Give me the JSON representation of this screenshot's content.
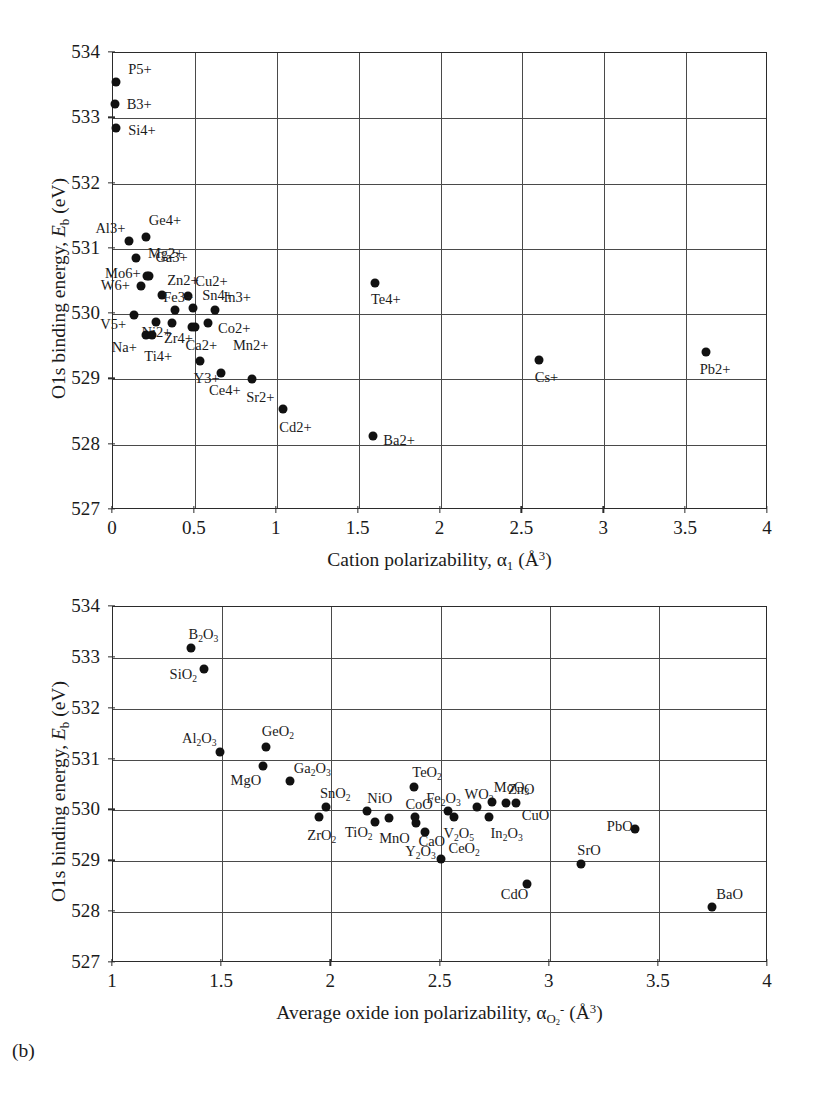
{
  "figure": {
    "panel_tag_b": "(b)",
    "y_axis_title_prefix": "O1s binding energy, ",
    "y_axis_title_symbol": "E",
    "y_axis_title_symbol_sub": "b",
    "y_axis_title_unit": " (eV)",
    "y_ticks": [
      "527",
      "528",
      "529",
      "530",
      "531",
      "532",
      "533",
      "534"
    ],
    "y_min": 527,
    "y_max": 534
  },
  "chart_data": [
    {
      "type": "scatter",
      "panel": "a",
      "title": "",
      "xlabel": "Cation polarizability, α₁ (Å³)",
      "ylabel": "O1s binding energy, Eb (eV)",
      "xlim": [
        0,
        4
      ],
      "ylim": [
        527,
        534
      ],
      "xticks": [
        "0",
        "0.5",
        "1",
        "1.5",
        "2",
        "2.5",
        "3",
        "3.5",
        "4"
      ],
      "yticks": [
        "527",
        "528",
        "529",
        "530",
        "531",
        "532",
        "533",
        "534"
      ],
      "grid": true,
      "legend": "none",
      "points": [
        {
          "label": "P5+",
          "x": 0.02,
          "y": 533.55,
          "lx": 12,
          "ly": -14
        },
        {
          "label": "B3+",
          "x": 0.01,
          "y": 533.22,
          "lx": 12,
          "ly": -1
        },
        {
          "label": "Si4+",
          "x": 0.02,
          "y": 532.85,
          "lx": 12,
          "ly": 1
        },
        {
          "label": "Al3+",
          "x": 0.1,
          "y": 531.12,
          "lx": -34,
          "ly": -14
        },
        {
          "label": "Ge4+",
          "x": 0.2,
          "y": 531.18,
          "lx": 3,
          "ly": -18
        },
        {
          "label": "Mg2+",
          "x": 0.14,
          "y": 530.86,
          "lx": 12,
          "ly": -6
        },
        {
          "label": "Mo6+",
          "x": 0.22,
          "y": 530.58,
          "lx": -44,
          "ly": -4
        },
        {
          "label": "Ga3+",
          "x": 0.21,
          "y": 530.58,
          "lx": 8,
          "ly": -20
        },
        {
          "label": "W6+",
          "x": 0.17,
          "y": 530.43,
          "lx": -40,
          "ly": -2
        },
        {
          "label": "Zn2+",
          "x": 0.3,
          "y": 530.3,
          "lx": 5,
          "ly": -16
        },
        {
          "label": "Cu2+",
          "x": 0.46,
          "y": 530.28,
          "lx": 7,
          "ly": -16
        },
        {
          "label": "Fe3+",
          "x": 0.38,
          "y": 530.06,
          "lx": -12,
          "ly": -14
        },
        {
          "label": "Sn4+",
          "x": 0.49,
          "y": 530.1,
          "lx": 9,
          "ly": -14
        },
        {
          "label": "In3+",
          "x": 0.62,
          "y": 530.07,
          "lx": 9,
          "ly": -14
        },
        {
          "label": "V5+",
          "x": 0.13,
          "y": 529.98,
          "lx": -34,
          "ly": 8
        },
        {
          "label": "Ni2+",
          "x": 0.26,
          "y": 529.88,
          "lx": -14,
          "ly": 9
        },
        {
          "label": "Zr4+",
          "x": 0.36,
          "y": 529.86,
          "lx": -8,
          "ly": 14
        },
        {
          "label": "Co2+",
          "x": 0.58,
          "y": 529.86,
          "lx": 10,
          "ly": 4
        },
        {
          "label": "Ca2+",
          "x": 0.48,
          "y": 529.8,
          "lx": -6,
          "ly": 17
        },
        {
          "label": "Mn2+",
          "x": 0.5,
          "y": 529.8,
          "lx": 38,
          "ly": 17
        },
        {
          "label": "Na+",
          "x": 0.2,
          "y": 529.68,
          "lx": -34,
          "ly": 11
        },
        {
          "label": "Ti4+",
          "x": 0.24,
          "y": 529.68,
          "lx": -8,
          "ly": 20
        },
        {
          "label": "Y3+",
          "x": 0.53,
          "y": 529.28,
          "lx": -6,
          "ly": 16
        },
        {
          "label": "Ce4+",
          "x": 0.66,
          "y": 529.1,
          "lx": -12,
          "ly": 16
        },
        {
          "label": "Sr2+",
          "x": 0.85,
          "y": 529.0,
          "lx": -6,
          "ly": 17
        },
        {
          "label": "Cd2+",
          "x": 1.04,
          "y": 528.55,
          "lx": -4,
          "ly": 17
        },
        {
          "label": "Ba2+",
          "x": 1.59,
          "y": 528.13,
          "lx": 10,
          "ly": 3
        },
        {
          "label": "Te4+",
          "x": 1.6,
          "y": 530.47,
          "lx": -4,
          "ly": 15
        },
        {
          "label": "Cs+",
          "x": 2.6,
          "y": 529.3,
          "lx": -4,
          "ly": 16
        },
        {
          "label": "Pb2+",
          "x": 3.62,
          "y": 529.42,
          "lx": -6,
          "ly": 16
        }
      ]
    },
    {
      "type": "scatter",
      "panel": "b",
      "title": "",
      "xlabel": "Average oxide ion polarizability, αO2- (Å³)",
      "ylabel": "O1s binding energy, Eb (eV)",
      "xlim": [
        1,
        4
      ],
      "ylim": [
        527,
        534
      ],
      "xticks": [
        "1",
        "1.5",
        "2",
        "2.5",
        "3",
        "3.5",
        "4"
      ],
      "yticks": [
        "527",
        "528",
        "529",
        "530",
        "531",
        "532",
        "533",
        "534"
      ],
      "grid": true,
      "legend": "none",
      "points": [
        {
          "label": "B2O3",
          "html": "B<sub>2</sub>O<sub>3</sub>",
          "x": 1.355,
          "y": 533.19,
          "lx": -2,
          "ly": -15
        },
        {
          "label": "SiO2",
          "html": "SiO<sub>2</sub>",
          "x": 1.415,
          "y": 532.78,
          "lx": -34,
          "ly": 4
        },
        {
          "label": "Al2O3",
          "html": "Al<sub>2</sub>O<sub>3</sub>",
          "x": 1.49,
          "y": 531.14,
          "lx": -38,
          "ly": -15
        },
        {
          "label": "GeO2",
          "html": "GeO<sub>2</sub>",
          "x": 1.7,
          "y": 531.24,
          "lx": -4,
          "ly": -17
        },
        {
          "label": "MgO",
          "html": "MgO",
          "x": 1.685,
          "y": 530.87,
          "lx": -32,
          "ly": 13
        },
        {
          "label": "Ga2O3",
          "html": "Ga<sub>2</sub>O<sub>3</sub>",
          "x": 1.81,
          "y": 530.58,
          "lx": 4,
          "ly": -14
        },
        {
          "label": "SnO2",
          "html": "SnO<sub>2</sub>",
          "x": 1.975,
          "y": 530.07,
          "lx": -6,
          "ly": -15
        },
        {
          "label": "ZrO2",
          "html": "ZrO<sub>2</sub>",
          "x": 1.945,
          "y": 529.87,
          "lx": -12,
          "ly": 17
        },
        {
          "label": "NiO",
          "html": "NiO",
          "x": 2.165,
          "y": 529.98,
          "lx": 0,
          "ly": -14
        },
        {
          "label": "TiO2",
          "html": "TiO<sub>2</sub>",
          "x": 2.2,
          "y": 529.78,
          "lx": -30,
          "ly": 9
        },
        {
          "label": "MnO",
          "html": "MnO",
          "x": 2.265,
          "y": 529.85,
          "lx": -10,
          "ly": 19
        },
        {
          "label": "TeO2",
          "html": "TeO<sub>2</sub>",
          "x": 2.38,
          "y": 530.46,
          "lx": -2,
          "ly": -16
        },
        {
          "label": "CoO",
          "html": "CoO",
          "x": 2.385,
          "y": 529.87,
          "lx": -10,
          "ly": -14
        },
        {
          "label": "CaO",
          "html": "CaO",
          "x": 2.39,
          "y": 529.76,
          "lx": 2,
          "ly": 17
        },
        {
          "label": "Y2O3",
          "html": "Y<sub>2</sub>O<sub>3</sub>",
          "x": 2.43,
          "y": 529.58,
          "lx": -20,
          "ly": 18
        },
        {
          "label": "Fe2O3",
          "html": "Fe<sub>2</sub>O<sub>3</sub>",
          "x": 2.535,
          "y": 529.98,
          "lx": -22,
          "ly": -14
        },
        {
          "label": "V2O5",
          "html": "V<sub>2</sub>O<sub>5</sub>",
          "x": 2.56,
          "y": 529.87,
          "lx": -10,
          "ly": 15
        },
        {
          "label": "CeO2",
          "html": "CeO<sub>2</sub>",
          "x": 2.5,
          "y": 529.05,
          "lx": 8,
          "ly": -12
        },
        {
          "label": "WO3",
          "html": "WO<sub>3</sub>",
          "x": 2.665,
          "y": 530.06,
          "lx": -12,
          "ly": -14
        },
        {
          "label": "MoO3",
          "html": "MoO<sub>3</sub>",
          "x": 2.735,
          "y": 530.17,
          "lx": 2,
          "ly": -16
        },
        {
          "label": "In2O3",
          "html": "In<sub>2</sub>O<sub>3</sub>",
          "x": 2.72,
          "y": 529.88,
          "lx": 2,
          "ly": 15
        },
        {
          "label": "ZnO",
          "html": "ZnO",
          "x": 2.8,
          "y": 530.14,
          "lx": 2,
          "ly": -15
        },
        {
          "label": "CuO",
          "html": "CuO",
          "x": 2.845,
          "y": 530.14,
          "lx": 6,
          "ly": 11
        },
        {
          "label": "CdO",
          "html": "CdO",
          "x": 2.895,
          "y": 528.55,
          "lx": -26,
          "ly": 9
        },
        {
          "label": "SrO",
          "html": "SrO",
          "x": 3.145,
          "y": 528.95,
          "lx": -4,
          "ly": -15
        },
        {
          "label": "PbO",
          "html": "PbO",
          "x": 3.39,
          "y": 529.64,
          "lx": -28,
          "ly": -4
        },
        {
          "label": "BaO",
          "html": "BaO",
          "x": 3.745,
          "y": 528.11,
          "lx": 4,
          "ly": -14
        }
      ]
    }
  ]
}
